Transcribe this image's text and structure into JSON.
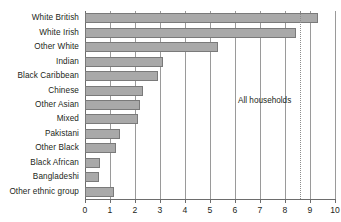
{
  "chart_data": {
    "type": "bar",
    "orientation": "horizontal",
    "title": "",
    "subtitle": "",
    "xlabel": "",
    "ylabel": "",
    "xlim": [
      0,
      10
    ],
    "ylim": null,
    "grid": true,
    "legend_position": "none",
    "xticks": [
      "0",
      "1",
      "2",
      "3",
      "4",
      "5",
      "6",
      "7",
      "8",
      "9",
      "10"
    ],
    "categories": [
      "White British",
      "White Irish",
      "Other White",
      "Indian",
      "Black Caribbean",
      "Chinese",
      "Other Asian",
      "Mixed",
      "Pakistani",
      "Other Black",
      "Black African",
      "Bangladeshi",
      "Other ethnic group"
    ],
    "values": [
      9.3,
      8.45,
      5.3,
      3.1,
      2.9,
      2.3,
      2.2,
      2.1,
      1.4,
      1.25,
      0.6,
      0.55,
      1.15
    ],
    "series": [
      {
        "name": "Percentage",
        "values": [
          9.3,
          8.45,
          5.3,
          3.1,
          2.9,
          2.3,
          2.2,
          2.1,
          1.4,
          1.25,
          0.6,
          0.55,
          1.15
        ]
      }
    ],
    "annotations": [
      {
        "label": "All households",
        "value": 8.6,
        "style": "dotted-vertical-reference-line"
      }
    ],
    "colors": {
      "bar_fill": "#a9a9a9",
      "bar_border": "#7a7a7a",
      "gridline": "#9a9a9a",
      "axis": "#6d6d6d",
      "reference_line": "#8c8c8c",
      "text": "#231f20",
      "background": "#ffffff"
    }
  }
}
